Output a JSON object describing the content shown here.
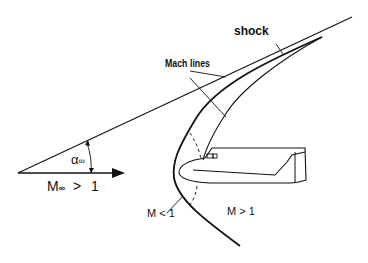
{
  "diagram": {
    "labels": {
      "shock": "shock",
      "mach_lines": "Mach lines",
      "alpha": "α",
      "alpha_sub": "∞",
      "freestream_M": "M",
      "freestream_sub": "∞",
      "freestream_cond": "> 1",
      "subsonic_region": "M < 1",
      "supersonic_region": "M > 1"
    },
    "colors": {
      "line": "#111111",
      "background": "#ffffff"
    }
  }
}
